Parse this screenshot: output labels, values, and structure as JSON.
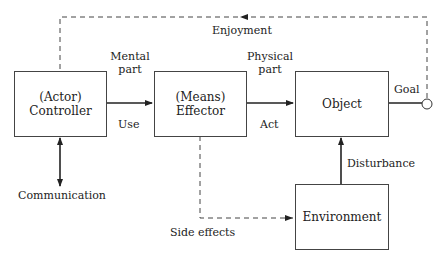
{
  "diagram": {
    "boxes": {
      "controller": {
        "line1": "(Actor)",
        "line2": "Controller"
      },
      "effector": {
        "line1": "(Means)",
        "line2": "Effector"
      },
      "object": {
        "label": "Object"
      },
      "environment": {
        "label": "Environment"
      }
    },
    "labels": {
      "enjoyment": "Enjoyment",
      "mental_part_1": "Mental",
      "mental_part_2": "part",
      "use": "Use",
      "physical_part_1": "Physical",
      "physical_part_2": "part",
      "act": "Act",
      "goal": "Goal",
      "disturbance": "Disturbance",
      "communication": "Communication",
      "side_effects": "Side effects"
    },
    "colors": {
      "line": "#222222",
      "box_border": "#444444"
    }
  }
}
